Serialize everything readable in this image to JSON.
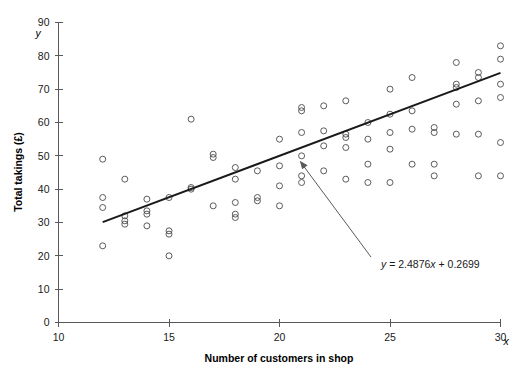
{
  "chart_data": {
    "type": "scatter",
    "title": "",
    "subtitle": "",
    "xlabel": "Number of customers in shop",
    "ylabel": "Total takings (£)",
    "x_axis_symbol": "x",
    "y_axis_symbol": "y",
    "xlim": [
      10,
      30
    ],
    "ylim": [
      0,
      90
    ],
    "xticks": [
      10,
      15,
      20,
      25,
      30
    ],
    "xtick_labels": [
      "10",
      "15",
      "20",
      "25",
      "30"
    ],
    "yticks": [
      0,
      10,
      20,
      30,
      40,
      50,
      60,
      70,
      80,
      90
    ],
    "ytick_labels": [
      "0",
      "10",
      "20",
      "30",
      "40",
      "50",
      "60",
      "70",
      "80",
      "90"
    ],
    "grid": false,
    "legend": null,
    "marker": "open-circle",
    "marker_color": "#4a4a4a",
    "points": [
      [
        12,
        49.0
      ],
      [
        12,
        37.5
      ],
      [
        12,
        34.5
      ],
      [
        12,
        23.0
      ],
      [
        13,
        43.0
      ],
      [
        13,
        32.0
      ],
      [
        13,
        30.5
      ],
      [
        13,
        29.5
      ],
      [
        14,
        37.0
      ],
      [
        14,
        33.5
      ],
      [
        14,
        32.5
      ],
      [
        14,
        29.0
      ],
      [
        15,
        37.5
      ],
      [
        15,
        27.5
      ],
      [
        15,
        26.5
      ],
      [
        15,
        20.0
      ],
      [
        16,
        40.5
      ],
      [
        16,
        40.0
      ],
      [
        16,
        61.0
      ],
      [
        17,
        50.5
      ],
      [
        17,
        49.5
      ],
      [
        17,
        35.0
      ],
      [
        18,
        46.5
      ],
      [
        18,
        43.0
      ],
      [
        18,
        36.0
      ],
      [
        18,
        32.5
      ],
      [
        18,
        31.5
      ],
      [
        19,
        45.5
      ],
      [
        19,
        37.5
      ],
      [
        19,
        36.5
      ],
      [
        20,
        55.0
      ],
      [
        20,
        47.0
      ],
      [
        20,
        41.0
      ],
      [
        20,
        35.0
      ],
      [
        21,
        64.5
      ],
      [
        21,
        63.5
      ],
      [
        21,
        57.0
      ],
      [
        21,
        50.0
      ],
      [
        21,
        44.0
      ],
      [
        21,
        42.0
      ],
      [
        22,
        65.0
      ],
      [
        22,
        57.5
      ],
      [
        22,
        53.0
      ],
      [
        22,
        45.5
      ],
      [
        23,
        66.5
      ],
      [
        23,
        56.5
      ],
      [
        23,
        55.5
      ],
      [
        23,
        52.5
      ],
      [
        23,
        43.0
      ],
      [
        24,
        60.0
      ],
      [
        24,
        55.0
      ],
      [
        24,
        47.5
      ],
      [
        24,
        42.0
      ],
      [
        25,
        70.0
      ],
      [
        25,
        62.5
      ],
      [
        25,
        57.0
      ],
      [
        25,
        52.0
      ],
      [
        25,
        42.0
      ],
      [
        26,
        73.5
      ],
      [
        26,
        63.5
      ],
      [
        26,
        58.0
      ],
      [
        26,
        47.5
      ],
      [
        27,
        58.5
      ],
      [
        27,
        57.0
      ],
      [
        27,
        47.5
      ],
      [
        27,
        44.0
      ],
      [
        28,
        78.0
      ],
      [
        28,
        71.5
      ],
      [
        28,
        70.5
      ],
      [
        28,
        65.5
      ],
      [
        28,
        56.5
      ],
      [
        29,
        75.0
      ],
      [
        29,
        73.5
      ],
      [
        29,
        66.5
      ],
      [
        29,
        56.5
      ],
      [
        29,
        44.0
      ],
      [
        30,
        83.0
      ],
      [
        30,
        79.0
      ],
      [
        30,
        71.5
      ],
      [
        30,
        67.5
      ],
      [
        30,
        54.0
      ],
      [
        30,
        44.0
      ]
    ],
    "trendline": {
      "label": "y = 2.4876x + 0.2699",
      "equation_lhs": "y",
      "equation_rhs": " = 2.4876",
      "equation_var": "x",
      "equation_tail": " + 0.2699",
      "slope": 2.4876,
      "intercept": 0.2699,
      "x_start": 12,
      "x_end": 30,
      "color": "#1a1a1a"
    },
    "annotation": {
      "text": "y = 2.4876x + 0.2699",
      "points_to": "trendline"
    }
  }
}
